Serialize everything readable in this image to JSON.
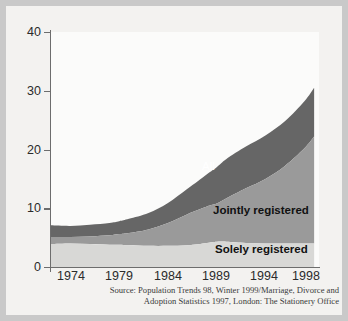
{
  "figure": {
    "background_color": "#c9c9c9",
    "page_color": "#f3f2f0",
    "plot_background": "#fbfbfa",
    "axis_color": "#6d6d6d"
  },
  "axis": {
    "y_ticks": [
      "40",
      "30",
      "20",
      "10",
      "0"
    ],
    "x_ticks": [
      "1974",
      "1979",
      "1984",
      "1989",
      "1994",
      "1998"
    ]
  },
  "labels": {
    "all": "All",
    "jointly": "Jointly registered",
    "solely": "Solely registered"
  },
  "source": {
    "line1": "Source: Population Trends 98, Winter 1999/Marriage, Divorce and",
    "line2": "Adoption Statistics 1997, London: The Stationery Office"
  },
  "chart_data": {
    "type": "area",
    "stacked": true,
    "title": "",
    "xlabel": "",
    "ylabel": "",
    "ylim": [
      0,
      40
    ],
    "xlim": [
      1972,
      1999.5
    ],
    "grid": false,
    "legend_position": "inside-right",
    "colors": {
      "solely_registered": "#d8d8d6",
      "jointly_registered": "#9a9a9a",
      "all_top_band": "#666666"
    },
    "x": [
      1972,
      1974,
      1976,
      1978,
      1979,
      1980,
      1982,
      1984,
      1986,
      1988,
      1989,
      1990,
      1992,
      1994,
      1996,
      1998,
      1999
    ],
    "series": [
      {
        "name": "Solely registered",
        "values": [
          3.9,
          4.0,
          3.9,
          3.8,
          3.8,
          3.7,
          3.6,
          3.6,
          3.7,
          4.1,
          4.3,
          4.3,
          4.1,
          4.0,
          4.0,
          4.0,
          4.0
        ]
      },
      {
        "name": "Jointly registered",
        "values": [
          1.2,
          1.1,
          1.3,
          1.6,
          1.8,
          2.1,
          2.8,
          3.9,
          5.3,
          6.2,
          6.5,
          7.4,
          9.3,
          11.0,
          13.2,
          16.2,
          18.2
        ]
      },
      {
        "name": "All (remainder to total)",
        "values": [
          2.0,
          1.9,
          2.0,
          2.1,
          2.2,
          2.4,
          2.8,
          3.4,
          4.3,
          5.5,
          6.2,
          6.7,
          7.1,
          7.4,
          7.6,
          8.0,
          8.3
        ]
      }
    ],
    "cumulative_totals": {
      "solely_top": [
        3.9,
        4.0,
        3.9,
        3.8,
        3.8,
        3.7,
        3.6,
        3.6,
        3.7,
        4.1,
        4.3,
        4.3,
        4.1,
        4.0,
        4.0,
        4.0,
        4.0
      ],
      "jointly_top": [
        5.1,
        5.1,
        5.2,
        5.4,
        5.6,
        5.8,
        6.4,
        7.5,
        9.0,
        10.3,
        10.8,
        11.7,
        13.4,
        15.0,
        17.2,
        20.2,
        22.2
      ],
      "total_top": [
        7.1,
        7.0,
        7.2,
        7.5,
        7.8,
        8.2,
        9.2,
        10.9,
        13.3,
        15.8,
        17.0,
        18.4,
        20.5,
        22.4,
        24.8,
        28.2,
        30.5
      ]
    }
  }
}
